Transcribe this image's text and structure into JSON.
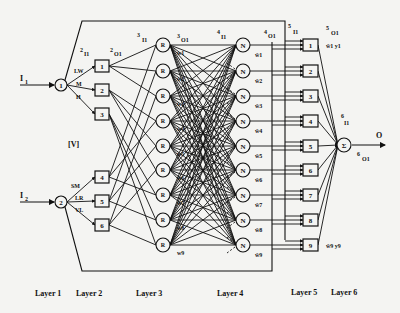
{
  "diagram": {
    "inputs": [
      {
        "label": "I",
        "sub": "1"
      },
      {
        "label": "I",
        "sub": "2"
      }
    ],
    "output": {
      "label": "O"
    },
    "layer1": {
      "nodes": [
        "1",
        "2"
      ]
    },
    "layer2": {
      "nodes": [
        "1",
        "2",
        "3",
        "4",
        "5",
        "6"
      ],
      "edge_labels_input1": [
        "LW",
        "M",
        "H"
      ],
      "edge_labels_input2": [
        "SM",
        "LR",
        "VL"
      ],
      "in_label": {
        "sup": "2",
        "text": "I1"
      },
      "out_label": {
        "sup": "2",
        "text": "O1"
      }
    },
    "layer3": {
      "node_symbol": "R",
      "count": 9,
      "in_label": {
        "sup": "3",
        "text": "I1"
      },
      "out_label": {
        "sup": "3",
        "text": "O1"
      },
      "weights": [
        "w1",
        "w2",
        "w3",
        "w4",
        "w5",
        "w6",
        "w7",
        "w8",
        "w9"
      ]
    },
    "layer4": {
      "node_symbol": "N",
      "count": 9,
      "in_label": {
        "sup": "4",
        "text": "I1"
      },
      "out_label": {
        "sup": "4",
        "text": "O1"
      },
      "weights": [
        "w̄1",
        "w̄2",
        "w̄3",
        "w̄4",
        "w̄5",
        "w̄6",
        "w̄7",
        "w̄8",
        "w̄9"
      ]
    },
    "layer5": {
      "nodes": [
        "1",
        "2",
        "3",
        "4",
        "5",
        "6",
        "7",
        "8",
        "9"
      ],
      "in_label": {
        "sup": "5",
        "text": "I1"
      },
      "out_label": {
        "sup": "5",
        "text": "O1"
      },
      "first_output": "w̄1 y1",
      "last_output": "w̄9 y9"
    },
    "layer6": {
      "node_symbol": "Σ",
      "in_label": {
        "sup": "6",
        "text": "I1"
      },
      "out_label": {
        "sup": "6",
        "text": "O1"
      }
    },
    "annotation": "[V]",
    "layer_labels": [
      "Layer 1",
      "Layer 2",
      "Layer 3",
      "Layer 4",
      "Layer 5",
      "Layer 6"
    ]
  }
}
